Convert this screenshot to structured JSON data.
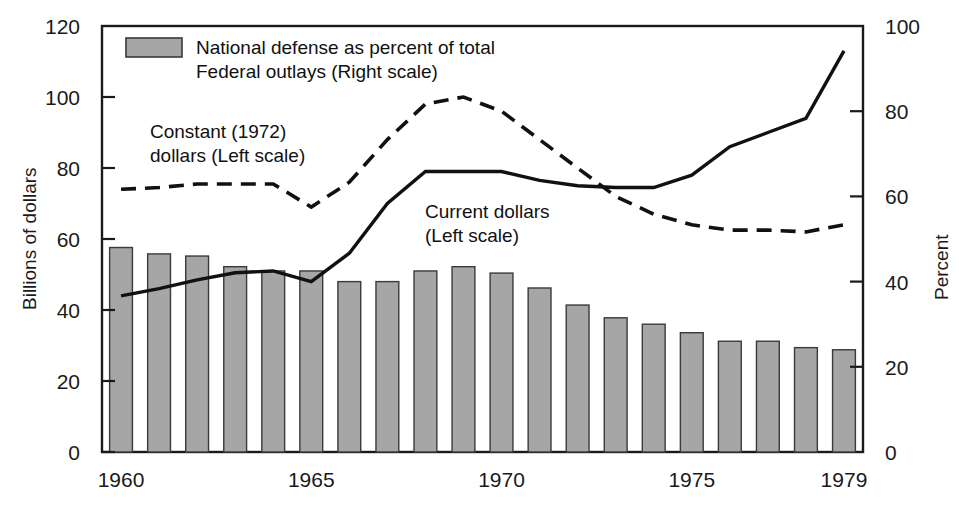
{
  "chart_data": {
    "type": "bar",
    "title": "",
    "xlabel": "",
    "ylabel": "Billions of dollars",
    "y2label": "Percent",
    "ylim": [
      0,
      120
    ],
    "y2lim": [
      0,
      100
    ],
    "grid": false,
    "legend_position": "top-left-inside",
    "x": [
      1960,
      1961,
      1962,
      1963,
      1964,
      1965,
      1966,
      1967,
      1968,
      1969,
      1970,
      1971,
      1972,
      1973,
      1974,
      1975,
      1976,
      1977,
      1978,
      1979
    ],
    "xticks": [
      "1960",
      "1965",
      "1970",
      "1975",
      "1979"
    ],
    "xtick_values": [
      1960,
      1965,
      1970,
      1975,
      1979
    ],
    "yticks": [
      "0",
      "20",
      "40",
      "60",
      "80",
      "100",
      "120"
    ],
    "ytick_values": [
      0,
      20,
      40,
      60,
      80,
      100,
      120
    ],
    "y2ticks": [
      "0",
      "20",
      "40",
      "60",
      "80",
      "100"
    ],
    "y2tick_values": [
      0,
      20,
      40,
      60,
      80,
      100
    ],
    "series": [
      {
        "name": "National defense as percent of total Federal outlays (Right scale)",
        "type": "bar",
        "axis": "right",
        "units": "percent",
        "color": "#a6a6a6",
        "values": [
          48.0,
          46.5,
          46.0,
          43.5,
          42.5,
          42.5,
          40.0,
          40.0,
          42.5,
          43.5,
          42.0,
          38.5,
          34.5,
          31.5,
          30.0,
          28.0,
          26.0,
          26.0,
          24.5,
          24.0
        ]
      },
      {
        "name": "Current dollars (Left scale)",
        "type": "line",
        "axis": "left",
        "units": "billions of dollars",
        "style": "solid",
        "color": "#111111",
        "values": [
          44.0,
          46.0,
          48.5,
          50.5,
          51.0,
          48.0,
          56.0,
          70.0,
          79.0,
          79.0,
          79.0,
          76.5,
          75.0,
          74.5,
          74.5,
          78.0,
          86.0,
          90.0,
          94.0,
          113.0
        ]
      },
      {
        "name": "Constant (1972) dollars (Left scale)",
        "type": "line",
        "axis": "left",
        "units": "billions of 1972 dollars",
        "style": "dashed",
        "color": "#111111",
        "values": [
          74.0,
          74.5,
          75.5,
          75.5,
          75.5,
          69.0,
          76.0,
          88.0,
          98.0,
          100.0,
          96.0,
          88.0,
          80.0,
          72.0,
          67.0,
          64.0,
          62.5,
          62.5,
          62.0,
          64.0
        ]
      }
    ],
    "annotations": [
      {
        "id": "constant-dollars-label",
        "text_line1": "Constant (1972)",
        "text_line2": "dollars (Left scale)",
        "x": 150,
        "y": 132
      },
      {
        "id": "current-dollars-label",
        "text_line1": "Current dollars",
        "text_line2": "(Left scale)",
        "x": 425,
        "y": 212
      }
    ]
  },
  "axes": {
    "left_title": "Billions of dollars",
    "right_title": "Percent",
    "left_ticks": [
      "120",
      "100",
      "80",
      "60",
      "40",
      "20",
      "0"
    ],
    "right_ticks": [
      "100",
      "80",
      "60",
      "40",
      "20",
      "0"
    ],
    "x_ticks": [
      "1960",
      "1965",
      "1970",
      "1975",
      "1979"
    ]
  },
  "legend": {
    "swatch_color": "#a6a6a6",
    "line1": "National defense as percent of total",
    "line2": "Federal outlays (Right scale)"
  },
  "annotations": {
    "constant_line1": "Constant (1972)",
    "constant_line2": "dollars (Left scale)",
    "current_line1": "Current dollars",
    "current_line2": "(Left scale)"
  }
}
